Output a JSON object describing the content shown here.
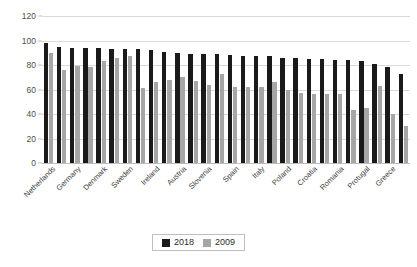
{
  "chart_data": {
    "type": "bar",
    "title": "",
    "subtitle": "",
    "xlabel": "",
    "ylabel": "",
    "ylim": [
      0,
      120
    ],
    "yticks": [
      0,
      20,
      40,
      60,
      80,
      100,
      120
    ],
    "grid": true,
    "legend_position": "bottom",
    "legend": [
      "2018",
      "2009"
    ],
    "categories": [
      "Netherlands",
      "",
      "Germany",
      "",
      "Denmark",
      "",
      "Sweden",
      "",
      "Ireland",
      "",
      "Austria",
      "",
      "Slovenia",
      "",
      "Spain",
      "",
      "Italy",
      "",
      "Poland",
      "",
      "Croatia",
      "",
      "Romania",
      "",
      "Protugal",
      "",
      "Greece",
      ""
    ],
    "visible_tick_labels": [
      "Netherlands",
      "Germany",
      "Denmark",
      "Sweden",
      "Ireland",
      "Austria",
      "Slovenia",
      "Spain",
      "Italy",
      "Poland",
      "Croatia",
      "Romania",
      "Protugal",
      "Greece"
    ],
    "series": [
      {
        "name": "2018",
        "color": "#1a1a1a",
        "values": [
          98,
          95,
          94,
          94,
          94,
          93,
          93,
          93,
          92,
          91,
          90,
          89,
          89,
          89,
          88,
          87,
          87,
          87,
          86,
          86,
          85,
          85,
          84,
          84,
          83,
          81,
          78,
          73
        ]
      },
      {
        "name": "2009",
        "color": "#a6a6a6",
        "values": [
          90,
          76,
          79,
          78,
          83,
          86,
          87,
          61,
          66,
          68,
          70,
          67,
          64,
          73,
          62,
          62,
          62,
          66,
          60,
          57,
          56,
          56,
          56,
          43,
          45,
          63,
          40,
          30
        ]
      }
    ]
  }
}
